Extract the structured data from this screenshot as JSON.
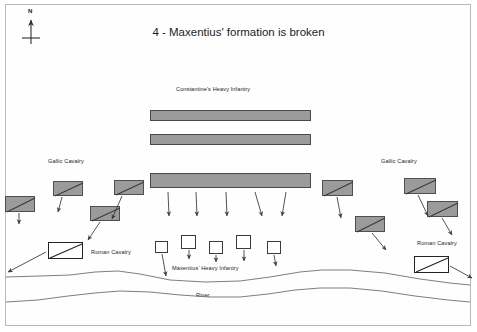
{
  "map": {
    "title": "4 - Maxentius' formation is broken",
    "width": 477,
    "height": 332,
    "background": "#ffffff",
    "border_color": "#b9b9b9"
  },
  "compass": {
    "label": "N",
    "icon": "north-arrow-icon"
  },
  "colors": {
    "cavalry_gray_fill": "#9b9b9b",
    "cavalry_gray_stroke": "#4f4f4f",
    "cavalry_white_fill": "#ffffff",
    "cavalry_white_stroke": "#232323",
    "infantry_bar_fill": "#9b9b9b",
    "infantry_bar_stroke": "#4a4a4a",
    "infantry_square_fill": "#ffffff",
    "infantry_square_stroke": "#3a3a3a",
    "arrow": "#3f3f3f",
    "river_line": "#6f6f6f",
    "text": "#1c1c1c"
  },
  "labels": {
    "constantine_infantry": "Constantine's Heavy Infantry",
    "gallic_cavalry_left": "Gallic Cavalry",
    "gallic_cavalry_right": "Gallic Cavalry",
    "roman_cavalry_left": "Roman Cavalry",
    "roman_cavalry_right": "Roman Cavalry",
    "maxentius_infantry": "Maxentius' Heavy Infantry",
    "river": "River"
  },
  "units": {
    "constantine_infantry_bars": [
      {
        "name": "infantry-bar-1",
        "x": 150,
        "y": 110,
        "w": 161,
        "h": 11
      },
      {
        "name": "infantry-bar-2",
        "x": 150,
        "y": 134,
        "w": 161,
        "h": 11
      },
      {
        "name": "infantry-bar-3",
        "x": 150,
        "y": 173,
        "w": 161,
        "h": 15
      }
    ],
    "gallic_cavalry_left": [
      {
        "name": "gallic-cavalry-left-1",
        "x": 5,
        "y": 196,
        "w": 30,
        "h": 16
      },
      {
        "name": "gallic-cavalry-left-2",
        "x": 53,
        "y": 181,
        "w": 30,
        "h": 15
      },
      {
        "name": "gallic-cavalry-left-3",
        "x": 114,
        "y": 180,
        "w": 30,
        "h": 15
      },
      {
        "name": "gallic-cavalry-left-4",
        "x": 90,
        "y": 206,
        "w": 30,
        "h": 15
      }
    ],
    "gallic_cavalry_right": [
      {
        "name": "gallic-cavalry-right-1",
        "x": 322,
        "y": 180,
        "w": 31,
        "h": 16
      },
      {
        "name": "gallic-cavalry-right-2",
        "x": 404,
        "y": 178,
        "w": 32,
        "h": 16
      },
      {
        "name": "gallic-cavalry-right-3",
        "x": 355,
        "y": 216,
        "w": 30,
        "h": 16
      },
      {
        "name": "gallic-cavalry-right-4",
        "x": 427,
        "y": 201,
        "w": 31,
        "h": 16
      }
    ],
    "roman_cavalry": [
      {
        "name": "roman-cavalry-left",
        "x": 48,
        "y": 242,
        "w": 35,
        "h": 17
      },
      {
        "name": "roman-cavalry-right",
        "x": 414,
        "y": 256,
        "w": 35,
        "h": 17
      }
    ],
    "maxentius_infantry_squares": [
      {
        "name": "maxentius-square-1",
        "x": 155,
        "y": 241,
        "w": 13,
        "h": 12
      },
      {
        "name": "maxentius-square-2",
        "x": 181,
        "y": 235,
        "w": 15,
        "h": 14
      },
      {
        "name": "maxentius-square-3",
        "x": 209,
        "y": 241,
        "w": 14,
        "h": 13
      },
      {
        "name": "maxentius-square-4",
        "x": 236,
        "y": 235,
        "w": 15,
        "h": 14
      },
      {
        "name": "maxentius-square-5",
        "x": 267,
        "y": 241,
        "w": 14,
        "h": 13
      }
    ]
  },
  "arrows": [
    {
      "name": "arrow-infantry-down-1",
      "x1": 168,
      "y1": 192,
      "x2": 169,
      "y2": 216
    },
    {
      "name": "arrow-infantry-down-2",
      "x1": 196,
      "y1": 192,
      "x2": 197,
      "y2": 216
    },
    {
      "name": "arrow-infantry-down-3",
      "x1": 226,
      "y1": 192,
      "x2": 227,
      "y2": 216
    },
    {
      "name": "arrow-infantry-down-4",
      "x1": 255,
      "y1": 192,
      "x2": 262,
      "y2": 216
    },
    {
      "name": "arrow-infantry-down-5",
      "x1": 286,
      "y1": 192,
      "x2": 282,
      "y2": 216
    },
    {
      "name": "arrow-gallic-left-1",
      "x1": 19,
      "y1": 213,
      "x2": 19,
      "y2": 224
    },
    {
      "name": "arrow-gallic-left-2",
      "x1": 62,
      "y1": 197,
      "x2": 58,
      "y2": 212
    },
    {
      "name": "arrow-gallic-left-3",
      "x1": 122,
      "y1": 196,
      "x2": 112,
      "y2": 219
    },
    {
      "name": "arrow-gallic-left-4",
      "x1": 100,
      "y1": 222,
      "x2": 88,
      "y2": 240
    },
    {
      "name": "arrow-roman-left",
      "x1": 46,
      "y1": 252,
      "x2": 8,
      "y2": 272
    },
    {
      "name": "arrow-gallic-right-1",
      "x1": 337,
      "y1": 197,
      "x2": 341,
      "y2": 218
    },
    {
      "name": "arrow-gallic-right-2",
      "x1": 418,
      "y1": 195,
      "x2": 428,
      "y2": 216
    },
    {
      "name": "arrow-gallic-right-3",
      "x1": 372,
      "y1": 233,
      "x2": 386,
      "y2": 250
    },
    {
      "name": "arrow-gallic-right-4",
      "x1": 442,
      "y1": 218,
      "x2": 452,
      "y2": 235
    },
    {
      "name": "arrow-roman-right",
      "x1": 450,
      "y1": 266,
      "x2": 472,
      "y2": 278
    },
    {
      "name": "arrow-maxentius-1",
      "x1": 162,
      "y1": 254,
      "x2": 166,
      "y2": 276
    },
    {
      "name": "arrow-maxentius-2",
      "x1": 189,
      "y1": 250,
      "x2": 189,
      "y2": 259
    },
    {
      "name": "arrow-maxentius-3",
      "x1": 216,
      "y1": 255,
      "x2": 216,
      "y2": 262
    },
    {
      "name": "arrow-maxentius-4",
      "x1": 244,
      "y1": 250,
      "x2": 244,
      "y2": 261
    },
    {
      "name": "arrow-maxentius-5",
      "x1": 274,
      "y1": 255,
      "x2": 276,
      "y2": 266
    }
  ],
  "river": {
    "label": "River",
    "upper_bank": "M 6,277 L 40,276 L 70,275 L 95,272 L 118,271 L 140,274 L 170,280 L 205,282 L 240,281 L 270,277 L 300,272 L 322,270 L 350,270 L 385,273 L 420,279 L 450,283 L 470,285",
    "lower_bank": "M 6,302 L 38,300 L 68,296 L 95,293 L 120,291 L 150,292 L 180,295 L 210,297 L 240,297 L 268,294 L 295,290 L 320,288 L 350,288 L 382,291 L 415,296 L 448,300 L 470,302"
  }
}
